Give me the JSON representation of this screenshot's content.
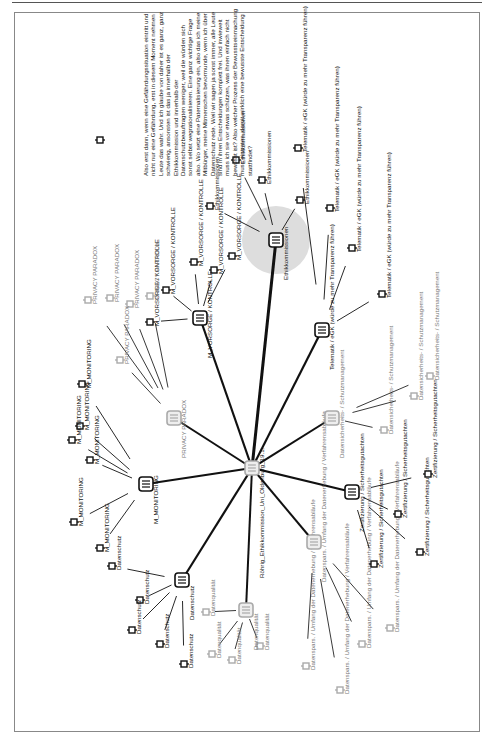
{
  "page": {
    "header_rule": true
  },
  "diagram": {
    "center": {
      "label": "Röhrig_Ethikkommission_Uni_Oldenburg_19.1.",
      "x": 252,
      "y": 468
    },
    "clusters": [
      {
        "id": "ethik",
        "label": "Ethikkommissionen",
        "x": 276,
        "y": 240,
        "highlight": true,
        "gray": false,
        "children": [
          "Ethikkommissionen",
          "Ethikkommissionen",
          "Ethikkommissionen",
          "Ethikkommissionen"
        ]
      },
      {
        "id": "vorsorge",
        "label": "M_VORSORGE / KONTROLLE",
        "x": 200,
        "y": 318,
        "gray": false,
        "children": [
          "M_VORSORGE / KONTROLLE",
          "M_VORSORGE / KONTROLLE",
          "M_VORSORGE / KONTROLLE",
          "M_VORSORGE / KONTROLLE",
          "M_VORSORGE / KONTROLLE"
        ]
      },
      {
        "id": "privacy",
        "label": "PRIVACY PARADOX",
        "x": 174,
        "y": 418,
        "gray": true,
        "children": [
          "PRIVACY PARADOX",
          "PRIVACY PARADOX",
          "PRIVACY PARADOX",
          "PRIVACY PARADOX",
          "PRIVACY PARADOX"
        ]
      },
      {
        "id": "monitoring",
        "label": "M_MONITORING",
        "x": 146,
        "y": 484,
        "gray": false,
        "children": [
          "M_MONITORING",
          "M_MONITORING",
          "M_MONITORING",
          "M_MONITORING",
          "M_MONITORING",
          "M_MONITORING"
        ]
      },
      {
        "id": "datenschutz",
        "label": "Datenschutz",
        "x": 182,
        "y": 580,
        "gray": false,
        "children": [
          "Datenschutz",
          "Datenschutz",
          "Datenschutz",
          "Datenschutz",
          "Datenschutz"
        ]
      },
      {
        "id": "datenqualitaet",
        "label": "Datenqualität",
        "x": 246,
        "y": 610,
        "gray": true,
        "children": [
          "Datenqualität",
          "Datenqualität",
          "Datenqualität",
          "Datenqualität"
        ]
      },
      {
        "id": "datensparsamkeit",
        "label": "Datenspars. / Umfang der Datenerhebung / Verfahrensabläufe",
        "x": 314,
        "y": 542,
        "gray": true,
        "children": [
          "Datenspars. / Umfang der Datenerhebung / Verfahrensabläufe",
          "Datenspars. / Umfang der Datenerhebung / Verfahrensabläufe",
          "Datenspars. / Umfang der Datenerhebung / Verfahrensabläufe",
          "Datenspars. / Umfang der Datenerhebung / Verfahrensabläufe"
        ]
      },
      {
        "id": "zertifizierung",
        "label": "Zertifizierung / Sicherheitsgutachten",
        "x": 352,
        "y": 492,
        "gray": false,
        "children": [
          "Zertifizierung / Sicherheitsgutachten",
          "Zertifizierung / Sicherheitsgutachten",
          "Zertifizierung / Sicherheitsgutachten",
          "Zertifizierung / Sicherheitsgutachten"
        ]
      },
      {
        "id": "datensicherheit",
        "label": "Datensicherheits- / Schutzmanagement",
        "x": 332,
        "y": 418,
        "gray": true,
        "children": [
          "Datensicherheits- / Schutzmanagement",
          "Datensicherheits- / Schutzmanagement",
          "Datensicherheits- / Schutzmanagement"
        ]
      },
      {
        "id": "telematik",
        "label": "Telematik / eGK (würde zu mehr Transparenz führen)",
        "x": 322,
        "y": 330,
        "gray": false,
        "children": [
          "Telematik / eGK (würde zu mehr Transparenz führen)",
          "Telematik / eGK (würde zu mehr Transparenz führen)",
          "Telematik / eGK (würde zu mehr Transparenz führen)",
          "Telematik / eGK (würde zu mehr Transparenz führen)"
        ]
      }
    ],
    "quote": [
      "Also erst dann, wenn eine Gefährdungssituation eintritt und",
      "nicht nur eine Gefährdung, erst in diesem Moment nehmen",
      "Leute das wahr. Und ich glaube von daher ist es ganz, ganz",
      "schwierig, ansonsten ist das ja innerhalb der",
      "Ethikkommission und innerhalb der",
      "Datenschutzbeauftragten weniger, weil die würden sich",
      "sonst selbst wegrationalisieren. Eine ganz wichtige Frage",
      "also. Wo setzt eine Paternalisierung ein, also das ich meine",
      "Mitbürger, meine Mitmenschen bevormunde, wenn ich über",
      "Datenschutz rede. Weil wir sagen ja sonst immer, alle Leute",
      "sind in ihren Entscheidungen komplett frei. Und inwieweit",
      "muss ich sie vor etwas schützen, was ihnen einfach nicht",
      "bewusst ist? Also welcher Prozess der Bewusstseinmachung",
      "muss eintreten, damit wirklich eine bewusste Entscheidung",
      "stattfindet?"
    ]
  }
}
